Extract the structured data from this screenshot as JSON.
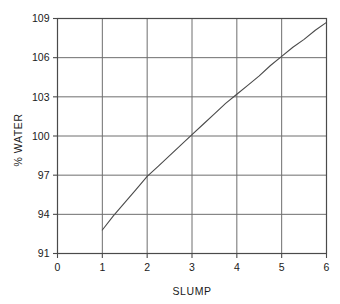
{
  "chart_data": {
    "type": "line",
    "title": "",
    "xlabel": "SLUMP",
    "ylabel": "% WATER",
    "xlim": [
      0,
      6
    ],
    "ylim": [
      91,
      109
    ],
    "grid": true,
    "legend": "none",
    "xticks": [
      "0",
      "1",
      "2",
      "3",
      "4",
      "5",
      "6"
    ],
    "yticks": [
      "91",
      "94",
      "97",
      "100",
      "103",
      "106",
      "109"
    ],
    "xtick_values": [
      0,
      1,
      2,
      3,
      4,
      5,
      6
    ],
    "ytick_values": [
      91,
      94,
      97,
      100,
      103,
      106,
      109
    ],
    "series": [
      {
        "name": "water-vs-slump",
        "color": "#4a4a4a",
        "x": [
          1.0,
          1.25,
          1.5,
          1.75,
          2.0,
          2.25,
          2.5,
          2.75,
          3.0,
          3.25,
          3.5,
          3.75,
          4.0,
          4.25,
          4.5,
          4.75,
          5.0,
          5.25,
          5.5,
          5.75,
          6.0
        ],
        "y": [
          92.8,
          93.9,
          94.9,
          95.9,
          96.9,
          97.7,
          98.5,
          99.3,
          100.1,
          100.9,
          101.7,
          102.5,
          103.2,
          103.9,
          104.6,
          105.4,
          106.1,
          106.8,
          107.4,
          108.1,
          108.7
        ]
      }
    ]
  },
  "axes": {
    "x_label": "SLUMP",
    "y_label": "% WATER"
  },
  "colors": {
    "curve": "#4a4a4a",
    "grid": "#6e6e6e",
    "frame": "#4a4a4a",
    "text": "#1a1a1a",
    "background": "#ffffff"
  }
}
